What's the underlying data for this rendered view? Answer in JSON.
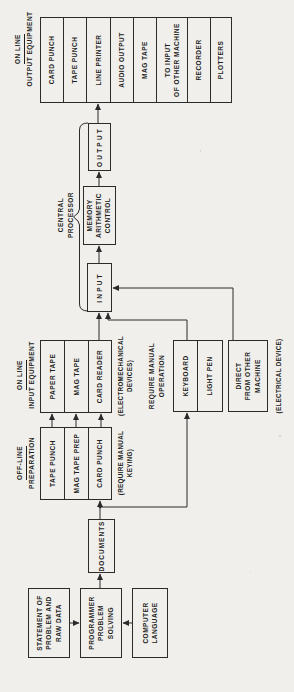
{
  "colors": {
    "background": "#f0efeb",
    "ink": "#1f1f1f",
    "line": "#2b2b2b"
  },
  "headings": {
    "offline": {
      "line1": "OFF-LINE",
      "line2": "PREPARATION"
    },
    "online_input": {
      "line1": "ON LINE",
      "line2": "INPUT EQUIPMENT"
    },
    "online_output": {
      "line1": "ON LINE",
      "line2": "OUTPUT EQUIPMENT"
    },
    "manual": {
      "line1": "REQUIRE MANUAL",
      "line2": "OPERATION"
    },
    "central_processor": {
      "line1": "CENTRAL",
      "line2": "PROCESSOR"
    }
  },
  "boxes": {
    "statement": "STATEMENT OF\nPROBLEM AND\nRAW DATA",
    "programmer": "PROGRAMMER\nPROBLEM\nSOLVING",
    "computer_language": "COMPUTER\nLANGUAGE",
    "documents": "DOCUMENTS",
    "input": "INPUT",
    "memory": "MEMORY\nARITHMETIC\nCONTROL",
    "output": "OUTPUT",
    "direct": "DIRECT\nFROM OTHER\nMACHINE"
  },
  "stacks": {
    "offline": [
      "TAPE PUNCH",
      "MAG TAPE PREP",
      "CARD PUNCH"
    ],
    "online_input": [
      "PAPER TAPE",
      "MAG TAPE",
      "CARD READER"
    ],
    "manual": [
      "KEYBOARD",
      "LIGHT PEN"
    ],
    "online_output": [
      "CARD PUNCH",
      "TAPE PUNCH",
      "LINE PRINTER",
      "AUDIO OUTPUT",
      "MAG TAPE",
      "TO INPUT\nOF OTHER MACHINE",
      "RECORDER",
      "PLOTTERS"
    ]
  },
  "notes": {
    "offline": "(REQUIRE MANUAL\nKEYING)",
    "online_input": "(ELECTROMECHANICAL\nDEVICES)",
    "direct": "(ELECTRICAL DEVICE)"
  }
}
